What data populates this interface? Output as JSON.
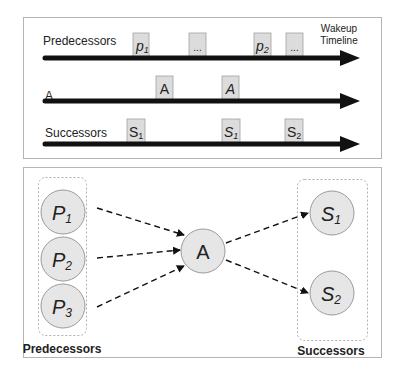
{
  "timeline_panel": {
    "axis_label": [
      "Wakeup",
      "Timeline"
    ],
    "rows": [
      {
        "label": "Predecessors",
        "events": [
          {
            "text": "p",
            "sub": "1",
            "italic": true
          },
          {
            "text": "...",
            "sub": "",
            "italic": false
          },
          {
            "text": "p",
            "sub": "2",
            "italic": true
          },
          {
            "text": "...",
            "sub": "",
            "italic": false
          }
        ]
      },
      {
        "label": "A",
        "events": [
          {
            "text": "A",
            "sub": "",
            "italic": false
          },
          {
            "text": "A",
            "sub": "",
            "italic": true
          }
        ]
      },
      {
        "label": "Successors",
        "events": [
          {
            "text": "S",
            "sub": "1",
            "italic": false
          },
          {
            "text": "S",
            "sub": "1",
            "italic": true
          },
          {
            "text": "S",
            "sub": "2",
            "italic": false
          }
        ]
      }
    ]
  },
  "graph_panel": {
    "predecessors_label": "Predecessors",
    "successors_label": "Successors",
    "predecessors": [
      {
        "text": "P",
        "sub": "1"
      },
      {
        "text": "P",
        "sub": "2"
      },
      {
        "text": "P",
        "sub": "3"
      }
    ],
    "center": {
      "text": "A"
    },
    "successors": [
      {
        "text": "S",
        "sub": "1"
      },
      {
        "text": "S",
        "sub": "2"
      }
    ]
  },
  "colors": {
    "node_fill": "#e6e6e6",
    "node_stroke": "#9a9a9a",
    "event_fill": "#dcdcdc",
    "panel_border": "#b5b5b5",
    "arrow": "#111111"
  }
}
